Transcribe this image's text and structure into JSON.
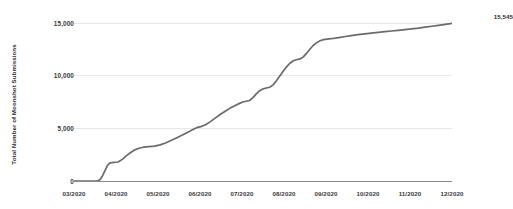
{
  "chart_data": {
    "type": "line",
    "title": "",
    "xlabel": "",
    "ylabel": "Total Number of Moonshot Submissions",
    "grid": true,
    "legend": false,
    "ylim": [
      0,
      16000
    ],
    "yticks": [
      0,
      5000,
      10000,
      15000
    ],
    "ytick_labels": [
      "0",
      "5,000",
      "10,000",
      "15,000"
    ],
    "categories": [
      "03/2020",
      "04/2020",
      "05/2020",
      "06/2020",
      "07/2020",
      "08/2020",
      "09/2020",
      "10/2020",
      "11/2020",
      "12/2020"
    ],
    "xtick_labels": [
      "03/2020",
      "04/2020",
      "05/2020",
      "06/2020",
      "07/2020",
      "08/2020",
      "09/2020",
      "10/2020",
      "11/2020",
      "12/2020"
    ],
    "line_color": "#6b6b6b",
    "grid_color": "#e8e8e8",
    "axis_color": "#8a8a8a",
    "end_label": "15,545",
    "end_value": 15545,
    "series": [
      {
        "name": "Total Number of Moonshot Submissions",
        "points": [
          [
            0.0,
            0
          ],
          [
            0.18,
            0
          ],
          [
            0.32,
            0
          ],
          [
            0.45,
            0
          ],
          [
            0.55,
            0
          ],
          [
            0.62,
            120
          ],
          [
            0.68,
            500
          ],
          [
            0.74,
            1000
          ],
          [
            0.8,
            1500
          ],
          [
            0.86,
            1720
          ],
          [
            0.95,
            1760
          ],
          [
            1.05,
            1800
          ],
          [
            1.15,
            2050
          ],
          [
            1.25,
            2400
          ],
          [
            1.35,
            2700
          ],
          [
            1.45,
            2950
          ],
          [
            1.55,
            3100
          ],
          [
            1.65,
            3200
          ],
          [
            1.78,
            3250
          ],
          [
            1.92,
            3300
          ],
          [
            2.05,
            3420
          ],
          [
            2.18,
            3600
          ],
          [
            2.32,
            3850
          ],
          [
            2.45,
            4100
          ],
          [
            2.58,
            4350
          ],
          [
            2.7,
            4600
          ],
          [
            2.82,
            4850
          ],
          [
            2.92,
            5050
          ],
          [
            3.02,
            5150
          ],
          [
            3.12,
            5300
          ],
          [
            3.24,
            5600
          ],
          [
            3.36,
            5950
          ],
          [
            3.48,
            6300
          ],
          [
            3.6,
            6600
          ],
          [
            3.72,
            6900
          ],
          [
            3.84,
            7150
          ],
          [
            3.94,
            7350
          ],
          [
            4.02,
            7480
          ],
          [
            4.1,
            7550
          ],
          [
            4.18,
            7620
          ],
          [
            4.26,
            7900
          ],
          [
            4.34,
            8250
          ],
          [
            4.42,
            8550
          ],
          [
            4.5,
            8720
          ],
          [
            4.58,
            8800
          ],
          [
            4.66,
            8880
          ],
          [
            4.74,
            9100
          ],
          [
            4.82,
            9500
          ],
          [
            4.9,
            9950
          ],
          [
            4.98,
            10400
          ],
          [
            5.06,
            10800
          ],
          [
            5.14,
            11150
          ],
          [
            5.22,
            11380
          ],
          [
            5.3,
            11480
          ],
          [
            5.38,
            11560
          ],
          [
            5.46,
            11750
          ],
          [
            5.54,
            12100
          ],
          [
            5.62,
            12500
          ],
          [
            5.7,
            12850
          ],
          [
            5.78,
            13100
          ],
          [
            5.86,
            13280
          ],
          [
            5.94,
            13380
          ],
          [
            6.02,
            13430
          ],
          [
            6.12,
            13470
          ],
          [
            6.22,
            13520
          ],
          [
            6.34,
            13600
          ],
          [
            6.46,
            13680
          ],
          [
            6.6,
            13760
          ],
          [
            6.76,
            13850
          ],
          [
            6.92,
            13930
          ],
          [
            7.08,
            14000
          ],
          [
            7.24,
            14070
          ],
          [
            7.4,
            14140
          ],
          [
            7.56,
            14200
          ],
          [
            7.72,
            14260
          ],
          [
            7.88,
            14330
          ],
          [
            8.04,
            14400
          ],
          [
            8.2,
            14470
          ],
          [
            8.36,
            14560
          ],
          [
            8.52,
            14650
          ],
          [
            8.68,
            14740
          ],
          [
            8.84,
            14830
          ],
          [
            9.0,
            14920
          ],
          [
            9.16,
            15020
          ],
          [
            9.32,
            15130
          ],
          [
            9.48,
            15250
          ],
          [
            9.62,
            15380
          ],
          [
            9.74,
            15480
          ],
          [
            9.84,
            15545
          ],
          [
            9.92,
            15545
          ]
        ]
      }
    ]
  }
}
